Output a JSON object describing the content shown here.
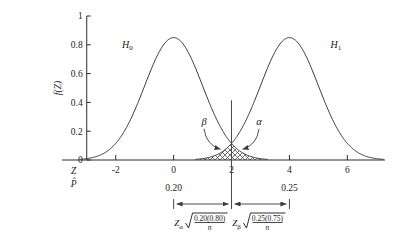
{
  "chart_data": {
    "type": "line",
    "title": "",
    "xlabel": "Z",
    "xlabel2": "P̂",
    "ylabel": "f(Z)",
    "xlim": [
      -4.2,
      7.3
    ],
    "ylim": [
      0,
      1
    ],
    "grid": false,
    "legend_position": "inline",
    "x_ticks": [
      "-2",
      "0",
      "2",
      "4",
      "6"
    ],
    "x_tick_values": [
      -2,
      0,
      2,
      4,
      6
    ],
    "y_ticks": [
      "0",
      "0.2",
      "0.4",
      "0.6",
      "0.8",
      "1"
    ],
    "y_tick_values": [
      0,
      0.2,
      0.4,
      0.6,
      0.8,
      1
    ],
    "series": [
      {
        "name": "H0",
        "label": "H",
        "label_sub": "0",
        "distribution": "normal",
        "mean": 0,
        "sd": 1,
        "peak": 0.85,
        "label_x": -1.6,
        "label_y": 0.78
      },
      {
        "name": "H1",
        "label": "H",
        "label_sub": "1",
        "distribution": "normal",
        "mean": 4,
        "sd": 1,
        "peak": 0.85,
        "label_x": 5.6,
        "label_y": 0.78
      }
    ],
    "critical_value": 2,
    "annotations": [
      {
        "name": "beta",
        "symbol": "β",
        "label_x": 1.05,
        "label_y": 0.245,
        "arrow_to_x": 1.62,
        "arrow_to_y": 0.075
      },
      {
        "name": "alpha",
        "symbol": "α",
        "label_x": 2.95,
        "label_y": 0.245,
        "arrow_to_x": 2.38,
        "arrow_to_y": 0.075
      }
    ],
    "shaded_region": {
      "name": "overlap-crosshatch",
      "from": 0.9,
      "to": 3.1,
      "hatch": "crosshatch"
    },
    "proportion_labels": [
      {
        "text": "0.20",
        "x": 0
      },
      {
        "text": "0.25",
        "x": 4
      }
    ],
    "dimensions": [
      {
        "name": "alpha-margin",
        "from": 0,
        "to": 2,
        "z_symbol": "Z",
        "z_sub": "α",
        "radicand_numerator": "0.20(0.80)",
        "radicand_denominator": "n"
      },
      {
        "name": "beta-margin",
        "from": 2,
        "to": 4,
        "z_symbol": "Z",
        "z_sub": "β",
        "radicand_numerator": "0.25(0.75)",
        "radicand_denominator": "n"
      }
    ]
  }
}
